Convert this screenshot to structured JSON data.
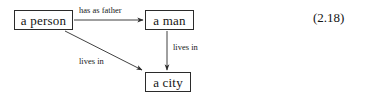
{
  "figure": {
    "equation_number": "(2.18)",
    "background_color": "#ffffff",
    "stroke_color": "#2b2b2b",
    "text_color": "#151515"
  },
  "nodes": [
    {
      "id": "person",
      "label": "a person"
    },
    {
      "id": "man",
      "label": "a man"
    },
    {
      "id": "city",
      "label": "a city"
    }
  ],
  "edges": [
    {
      "id": "person-man",
      "from": "a person",
      "to": "a man",
      "label": "has as father"
    },
    {
      "id": "man-city",
      "from": "a man",
      "to": "a city",
      "label": "lives in"
    },
    {
      "id": "person-city",
      "from": "a person",
      "to": "a city",
      "label": "lives in"
    }
  ]
}
